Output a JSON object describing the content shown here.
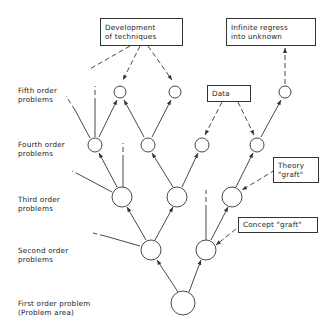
{
  "levels": [
    {
      "label": "Fifth order\nproblems"
    },
    {
      "label": "Fourth order\nproblems"
    },
    {
      "label": "Third order\nproblems"
    },
    {
      "label": "Second order\nproblems"
    },
    {
      "label": "First order problem\n(Problem area)"
    }
  ],
  "boxes": {
    "techniques": "Development\nof techniques",
    "regress": "Infinite regress\ninto unknown",
    "data": "Data",
    "theory": "Theory\n\"graft\"",
    "concept": "Concept \"graft\""
  },
  "colors": {
    "line": "#333333",
    "text": "#222222",
    "background": "#ffffff"
  }
}
